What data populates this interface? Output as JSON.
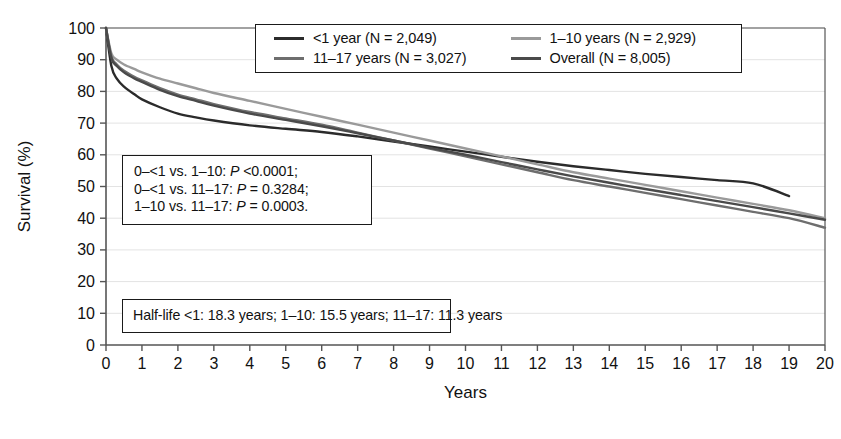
{
  "chart_data": {
    "type": "line",
    "title": "",
    "xlabel": "Years",
    "ylabel": "Survival (%)",
    "xlim": [
      0,
      20
    ],
    "ylim": [
      0,
      100
    ],
    "xticks": [
      "0",
      "1",
      "2",
      "3",
      "4",
      "5",
      "6",
      "7",
      "8",
      "9",
      "10",
      "11",
      "12",
      "13",
      "14",
      "15",
      "16",
      "17",
      "18",
      "19",
      "20"
    ],
    "yticks": [
      "0",
      "10",
      "20",
      "30",
      "40",
      "50",
      "60",
      "70",
      "80",
      "90",
      "100"
    ],
    "grid": "horizontal",
    "legend_position": "top-center",
    "series": [
      {
        "name": "<1 year (N = 2,049)",
        "color": "#2b2b2b",
        "x": [
          0,
          0.15,
          0.3,
          0.5,
          0.8,
          1,
          1.5,
          2,
          2.5,
          3,
          4,
          5,
          6,
          7,
          8,
          9,
          10,
          11,
          12,
          13,
          14,
          15,
          16,
          17,
          18,
          19
        ],
        "y": [
          100,
          88,
          84,
          81.5,
          79,
          77.5,
          75,
          73,
          71.8,
          70.8,
          69.3,
          68.2,
          67.2,
          65.8,
          64.2,
          62.6,
          61,
          59.4,
          57.8,
          56.4,
          55.2,
          54,
          53,
          52,
          51,
          47
        ]
      },
      {
        "name": "1-10 years (N = 2,929)",
        "color": "#9a9a9a",
        "x": [
          0,
          0.15,
          0.3,
          0.5,
          0.8,
          1,
          1.5,
          2,
          2.5,
          3,
          4,
          5,
          6,
          7,
          8,
          9,
          10,
          11,
          12,
          13,
          14,
          15,
          16,
          17,
          18,
          19,
          20
        ],
        "y": [
          100,
          92,
          90,
          88.5,
          87,
          86,
          84,
          82.5,
          81,
          79.5,
          77,
          74.5,
          72,
          69.5,
          67,
          64.5,
          62,
          59.5,
          57,
          54.5,
          52.5,
          50.5,
          48.5,
          46.5,
          44.5,
          42.5,
          40
        ]
      },
      {
        "name": "11-17 years (N = 3,027)",
        "color": "#6e6e6e",
        "x": [
          0,
          0.15,
          0.3,
          0.5,
          0.8,
          1,
          1.5,
          2,
          2.5,
          3,
          4,
          5,
          6,
          7,
          8,
          9,
          10,
          11,
          12,
          13,
          14,
          15,
          16,
          17,
          18,
          19,
          20
        ],
        "y": [
          100,
          91,
          88.5,
          86.5,
          84.5,
          83.5,
          81,
          79,
          77.5,
          76,
          73.5,
          71.5,
          69.5,
          67,
          64.5,
          62,
          59.5,
          57,
          54.5,
          52,
          50,
          48,
          46,
          44,
          42,
          40,
          37
        ]
      },
      {
        "name": "Overall (N = 8,005)",
        "color": "#4a4a4a",
        "x": [
          0,
          0.15,
          0.3,
          0.5,
          0.8,
          1,
          1.5,
          2,
          2.5,
          3,
          4,
          5,
          6,
          7,
          8,
          9,
          10,
          11,
          12,
          13,
          14,
          15,
          16,
          17,
          18,
          19,
          20
        ],
        "y": [
          100,
          90.5,
          88,
          86,
          84,
          83,
          80.5,
          78.5,
          77,
          75.5,
          73,
          71,
          69,
          66.8,
          64.5,
          62.2,
          60,
          57.7,
          55.4,
          53.2,
          51.2,
          49.2,
          47.3,
          45.4,
          43.5,
          41.5,
          39.5
        ]
      }
    ],
    "annotations": [
      {
        "name": "p-value-box",
        "lines": [
          {
            "pre": "0–<1 vs. 1–10: ",
            "ital": "P",
            "post": " <0.0001;"
          },
          {
            "pre": "0–<1 vs. 11–17: ",
            "ital": "P",
            "post": " = 0.3284;"
          },
          {
            "pre": "1–10 vs. 11–17: ",
            "ital": "P",
            "post": " = 0.0003."
          }
        ]
      },
      {
        "name": "half-life-box",
        "lines": [
          {
            "pre": "Half-life <1: 18.3 years; 1–10: 15.5 years; 11–17: 11.3 years",
            "ital": "",
            "post": ""
          }
        ]
      }
    ]
  },
  "legend": {
    "entries": [
      {
        "label": "<1 year (N = 2,049)",
        "color": "#2b2b2b"
      },
      {
        "label": "1–10 years (N = 2,929)",
        "color": "#9a9a9a"
      },
      {
        "label": "11–17 years (N = 3,027)",
        "color": "#6e6e6e"
      },
      {
        "label": "Overall (N = 8,005)",
        "color": "#4a4a4a"
      }
    ]
  },
  "axes": {
    "x_title": "Years",
    "y_title": "Survival (%)"
  }
}
